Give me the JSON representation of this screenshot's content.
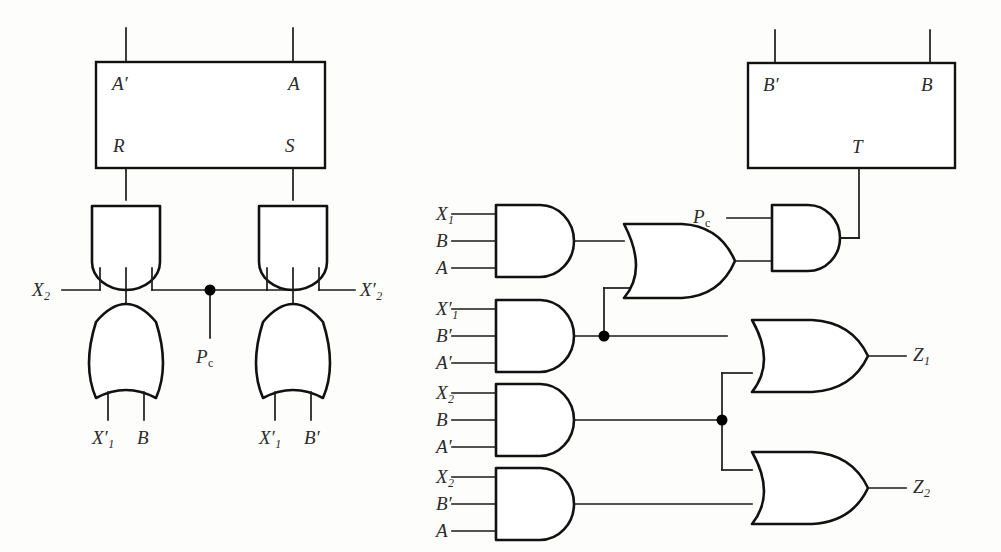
{
  "figure": {
    "background_color": "#fdfdfb",
    "line_color": "#111111"
  },
  "left_circuit": {
    "name": "rs-latch-control-network",
    "box": {
      "name": "rs-latch-block",
      "top_left_label": "A",
      "top_left_prime": "′",
      "top_right_label": "A",
      "bottom_left_label": "R",
      "bottom_right_label": "S"
    },
    "gates": [
      {
        "id": "and-left",
        "type": "and",
        "orientation": "down",
        "output_to": "R"
      },
      {
        "id": "and-right",
        "type": "and",
        "orientation": "down",
        "output_to": "S"
      },
      {
        "id": "or-left",
        "type": "or",
        "orientation": "up",
        "output_to": "and-left"
      },
      {
        "id": "or-right",
        "type": "or",
        "orientation": "up",
        "output_to": "and-right"
      }
    ],
    "labels": {
      "x2": "X",
      "x2_sub": "2",
      "x2_prime_label": "X",
      "x2_prime_sub": "2",
      "x2_prime_mark": "′",
      "pc": "P",
      "pc_sub": "c"
    },
    "or_left_inputs": [
      {
        "base": "X",
        "sub": "1",
        "prime": "′"
      },
      {
        "base": "B",
        "sub": "",
        "prime": ""
      }
    ],
    "or_right_inputs": [
      {
        "base": "X",
        "sub": "1",
        "prime": "′"
      },
      {
        "base": "B",
        "sub": "",
        "prime": "′"
      }
    ]
  },
  "right_circuit": {
    "name": "output-decode-network",
    "box": {
      "name": "t-flipflop-block",
      "top_left_label": "B",
      "top_left_prime": "′",
      "top_right_label": "B",
      "bottom_center_label": "T"
    },
    "and_gates": [
      {
        "id": "and-1",
        "inputs": [
          {
            "base": "X",
            "sub": "1",
            "prime": ""
          },
          {
            "base": "B",
            "sub": "",
            "prime": ""
          },
          {
            "base": "A",
            "sub": "",
            "prime": ""
          }
        ]
      },
      {
        "id": "and-2",
        "inputs": [
          {
            "base": "X",
            "sub": "1",
            "prime": "′"
          },
          {
            "base": "B",
            "sub": "",
            "prime": "′"
          },
          {
            "base": "A",
            "sub": "",
            "prime": "′"
          }
        ]
      },
      {
        "id": "and-3",
        "inputs": [
          {
            "base": "X",
            "sub": "2",
            "prime": ""
          },
          {
            "base": "B",
            "sub": "",
            "prime": ""
          },
          {
            "base": "A",
            "sub": "",
            "prime": "′"
          }
        ]
      },
      {
        "id": "and-4",
        "inputs": [
          {
            "base": "X",
            "sub": "2",
            "prime": ""
          },
          {
            "base": "B",
            "sub": "",
            "prime": "′"
          },
          {
            "base": "A",
            "sub": "",
            "prime": ""
          }
        ]
      }
    ],
    "or_gates": [
      {
        "id": "or-top",
        "output_to": "and-pc"
      },
      {
        "id": "or-z1",
        "output_label": "Z",
        "output_sub": "1"
      },
      {
        "id": "or-z2",
        "output_label": "Z",
        "output_sub": "2"
      }
    ],
    "and_pc": {
      "id": "and-pc",
      "input_label": "P",
      "input_sub": "c",
      "output_to": "T"
    },
    "outputs": [
      {
        "base": "Z",
        "sub": "1"
      },
      {
        "base": "Z",
        "sub": "2"
      }
    ]
  }
}
